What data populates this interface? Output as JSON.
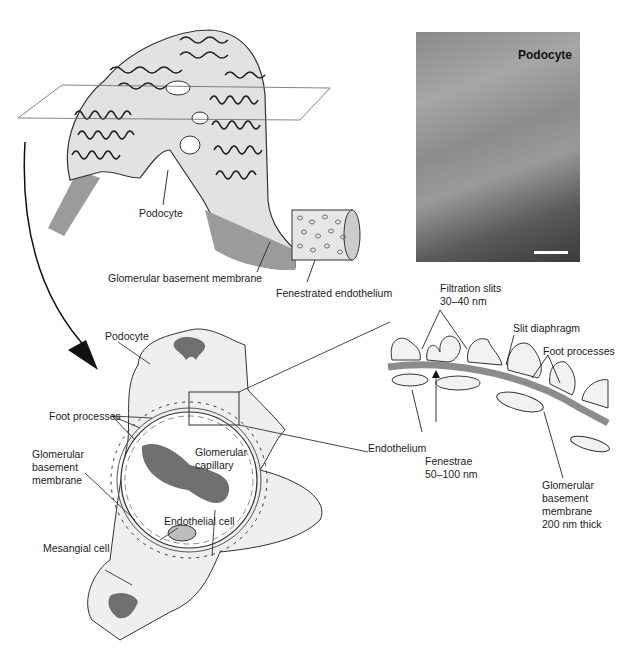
{
  "figure": {
    "top_right_caption": "",
    "bottom_caption": ""
  },
  "top_diagram": {
    "labels": {
      "podocyte": "Podocyte",
      "gbm": "Glomerular basement membrane",
      "fenestrated": "Fenestrated endothelium"
    }
  },
  "micrograph": {
    "title": "Podocyte",
    "scale_bar": true
  },
  "cross_section": {
    "labels": {
      "podocyte": "Podocyte",
      "foot_processes": "Foot processes",
      "gbm_line1": "Glomerular",
      "gbm_line2": "basement",
      "gbm_line3": "membrane",
      "capillary_line1": "Glomerular",
      "capillary_line2": "capillary",
      "endothelial_cell": "Endothelial cell",
      "mesangial_cell": "Mesangial cell"
    }
  },
  "detail": {
    "labels": {
      "filtration_slits_line1": "Filtration slits",
      "filtration_slits_line2": "30–40 nm",
      "slit_diaphragm": "Slit diaphragm",
      "foot_processes": "Foot processes",
      "endothelium": "Endothelium",
      "fenestrae_line1": "Fenestrae",
      "fenestrae_line2": "50–100 nm",
      "gbm_line1": "Glomerular",
      "gbm_line2": "basement",
      "gbm_line3": "membrane",
      "gbm_line4": "200 nm thick"
    }
  },
  "colors": {
    "cell_fill": "#e4e4e4",
    "membrane": "#8c8c8c",
    "nucleus": "#707070",
    "outline": "#333333"
  }
}
